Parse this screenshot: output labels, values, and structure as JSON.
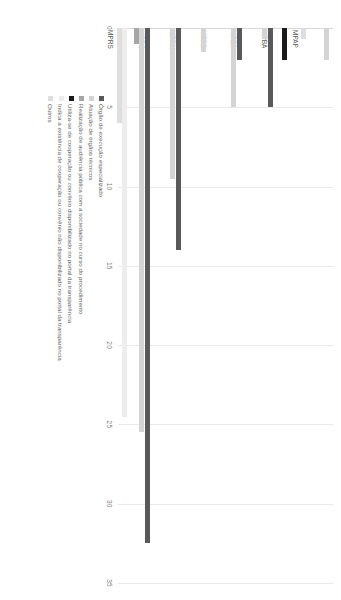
{
  "chart_data": {
    "type": "bar",
    "orientation": "horizontal",
    "title": "",
    "subtitle": "",
    "xlabel": "",
    "ylabel": "",
    "xlim": [
      0,
      35
    ],
    "xticks": [
      0,
      5,
      10,
      15,
      20,
      25,
      30,
      35
    ],
    "xtick_labels": [
      "0",
      "5",
      "10",
      "15",
      "20",
      "25",
      "30",
      "35"
    ],
    "grid": true,
    "legend_position": "bottom-left",
    "categories": [
      "MPAP",
      "MPBA",
      "MPES",
      "MPPB",
      "MPRN",
      "MPRO",
      "MPRS"
    ],
    "series": [
      {
        "name": "Órgão de execução especializado",
        "color": "#595959",
        "values": [
          0,
          0,
          5,
          2,
          0,
          14,
          32.5
        ]
      },
      {
        "name": "Atuação de órgãos técnicos",
        "color": "#d4d4d4",
        "values": [
          2,
          0,
          0.7,
          5,
          1.5,
          9.5,
          25.5
        ]
      },
      {
        "name": "Realização de audiência pública com a sociedade no curso do procedimento",
        "color": "#a6a6a6",
        "values": [
          0,
          0,
          0,
          0,
          0,
          0,
          1
        ]
      },
      {
        "name": "Utiliza-se de cooperação ou convênio disponibilizado no portal da transparência",
        "color": "#1a1a1a",
        "values": [
          0,
          2,
          0,
          0,
          0,
          0,
          0
        ]
      },
      {
        "name": "Indica a existência de cooperação ou convênio não disponibilizado no portal da transparência",
        "color": "#ededed",
        "values": [
          0,
          0,
          0,
          0,
          0,
          0,
          24.5
        ]
      },
      {
        "name": "Outros",
        "color": "#dedede",
        "values": [
          0.7,
          0,
          0,
          0,
          0,
          0,
          6
        ]
      }
    ]
  },
  "legend": {
    "items": [
      {
        "label": "Órgão de execução especializado",
        "color": "#595959"
      },
      {
        "label": "Atuação de órgãos técnicos",
        "color": "#d4d4d4"
      },
      {
        "label": "Realização de audiência pública com a sociedade no curso do procedimento",
        "color": "#a6a6a6"
      },
      {
        "label": "Utiliza-se de cooperação ou convênio disponibilizado no portal da transparência",
        "color": "#1a1a1a"
      },
      {
        "label": "Indica a existência de cooperação ou convênio não disponibilizado no portal da transparência",
        "color": "#ededed"
      },
      {
        "label": "Outros",
        "color": "#dedede"
      }
    ]
  }
}
